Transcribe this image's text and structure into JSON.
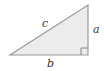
{
  "diagram": {
    "type": "right-triangle",
    "labels": {
      "hypotenuse": "c",
      "vertical_leg": "a",
      "horizontal_leg": "b"
    },
    "right_angle_marker": true,
    "colors": {
      "fill": "#ececec",
      "stroke": "#999999",
      "label": "#333333"
    }
  }
}
